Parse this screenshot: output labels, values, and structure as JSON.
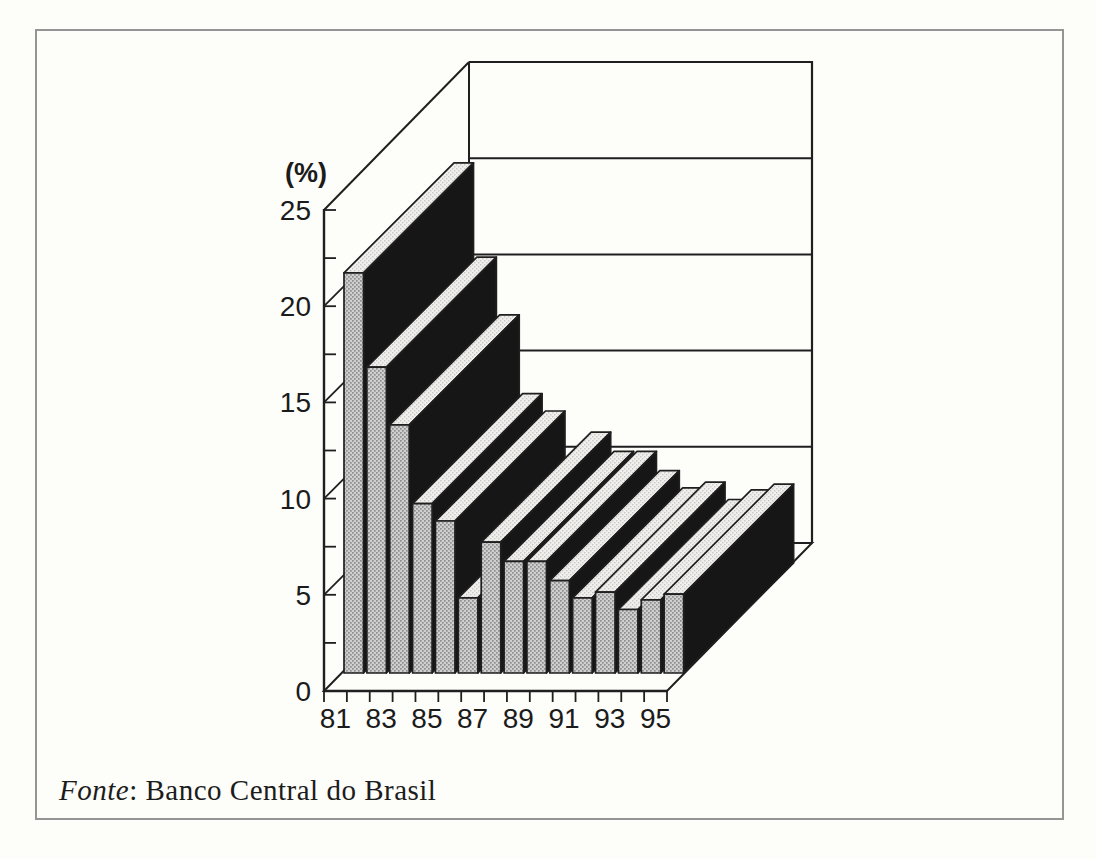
{
  "figure": {
    "unit_label": "(%)",
    "source_prefix": "Fonte",
    "source_rest": ": Banco Central do Brasil"
  },
  "chart_data": {
    "type": "bar",
    "style": "3d-oblique-column-chart",
    "title": "",
    "xlabel": "",
    "ylabel": "(%)",
    "categories": [
      "81",
      "82",
      "83",
      "84",
      "85",
      "86",
      "87",
      "88",
      "89",
      "90",
      "91",
      "92",
      "93",
      "94",
      "95"
    ],
    "values": [
      20.8,
      15.9,
      12.9,
      8.8,
      7.9,
      3.9,
      6.8,
      5.8,
      5.8,
      4.8,
      3.9,
      4.2,
      3.3,
      3.8,
      4.1
    ],
    "x_tick_labels": [
      "81",
      "83",
      "85",
      "87",
      "89",
      "91",
      "93",
      "95"
    ],
    "y_ticks": [
      0,
      5,
      10,
      15,
      20,
      25
    ],
    "y_tick_labels": [
      "0",
      "5",
      "10",
      "15",
      "20",
      "25"
    ],
    "y_minor_tick_step": 2.5,
    "ylim": [
      0,
      25
    ],
    "grid": "horizontal-lines-on-back-wall",
    "legend": "none",
    "source": "Banco Central do Brasil"
  },
  "colors": {
    "bar_front": "#cfcfcf",
    "bar_front_dot": "#8e8e8e",
    "bar_top": "#f0efec",
    "bar_top_dot": "#c9c9c9",
    "bar_side": "#161616",
    "line": "#1f1f1f",
    "text": "#1b1b1b",
    "background": "#fdfdfa",
    "border": "#959595"
  }
}
